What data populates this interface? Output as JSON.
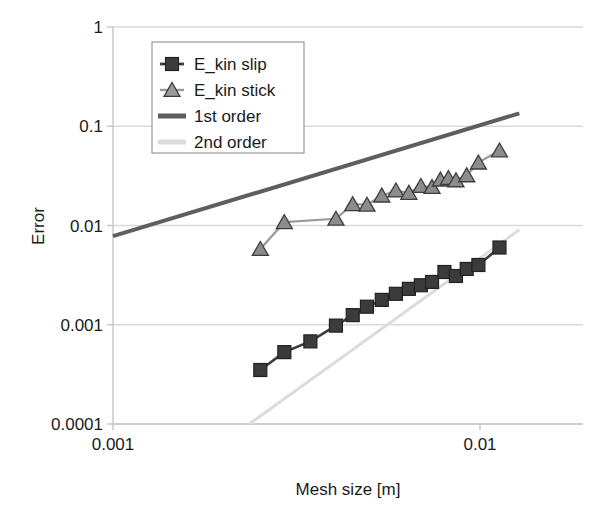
{
  "chart_data": {
    "type": "line",
    "title": "",
    "xlabel": "Mesh size [m]",
    "ylabel": "Error",
    "xscale": "log",
    "yscale": "log",
    "xlim": [
      0.001,
      0.0128
    ],
    "ylim": [
      0.0001,
      1
    ],
    "grid": true,
    "legend_position": "top-left",
    "xticks": [
      0.001,
      0.01
    ],
    "xtick_labels": [
      "0.001",
      "0.01"
    ],
    "yticks": [
      0.0001,
      0.001,
      0.01,
      0.1,
      1
    ],
    "ytick_labels": [
      "0.0001",
      "0.001",
      "0.01",
      "0.1",
      "1"
    ],
    "series": [
      {
        "name": "E_kin slip",
        "marker": "square",
        "color": "#3b3b3b",
        "line_color": "#3b3b3b",
        "x": [
          0.00252,
          0.00293,
          0.00345,
          0.00405,
          0.0045,
          0.00492,
          0.0054,
          0.0059,
          0.0064,
          0.0069,
          0.0074,
          0.008,
          0.0086,
          0.0092,
          0.0099,
          0.0113
        ],
        "y": [
          0.00035,
          0.00053,
          0.00068,
          0.00098,
          0.00125,
          0.00152,
          0.00178,
          0.00205,
          0.0023,
          0.0025,
          0.0027,
          0.0034,
          0.0031,
          0.00365,
          0.004,
          0.006
        ]
      },
      {
        "name": "E_kin stick",
        "marker": "triangle",
        "color": "#8c8c8c",
        "line_color": "#9a9a9a",
        "x": [
          0.00252,
          0.00293,
          0.00405,
          0.0045,
          0.00492,
          0.0054,
          0.0059,
          0.0064,
          0.0069,
          0.0074,
          0.0078,
          0.0082,
          0.0086,
          0.0092,
          0.0099,
          0.0113
        ],
        "y": [
          0.0058,
          0.0108,
          0.0117,
          0.0164,
          0.0162,
          0.02,
          0.0225,
          0.0213,
          0.025,
          0.0244,
          0.029,
          0.03,
          0.0285,
          0.032,
          0.043,
          0.057
        ]
      }
    ],
    "reference_lines": [
      {
        "name": "1st order",
        "slope": 1,
        "color": "#5e5e5e",
        "width": 4,
        "x": [
          0.001,
          0.0128
        ],
        "y": [
          0.0078,
          0.135
        ]
      },
      {
        "name": "2nd order",
        "slope": 2,
        "color": "#dcdcdc",
        "width": 3,
        "x": [
          0.00235,
          0.0128
        ],
        "y": [
          0.0001,
          0.00905
        ]
      }
    ],
    "legend_entries": [
      {
        "label": "E_kin slip",
        "marker": "square",
        "color": "#3b3b3b"
      },
      {
        "label": "E_kin stick",
        "marker": "triangle",
        "color": "#9a9a9a"
      },
      {
        "label": "1st order",
        "marker": "line",
        "color": "#5e5e5e"
      },
      {
        "label": "2nd order",
        "marker": "line",
        "color": "#dcdcdc"
      }
    ]
  },
  "axes": {
    "y_title": "Error",
    "x_title": "Mesh size [m]",
    "y_labels": [
      "1",
      "0.1",
      "0.01",
      "0.001",
      "0.0001"
    ],
    "x_labels": [
      "0.001",
      "0.01"
    ]
  },
  "legend": {
    "item0": "E_kin slip",
    "item1": "E_kin stick",
    "item2": "1st order",
    "item3": "2nd order"
  },
  "colors": {
    "slip": "#3b3b3b",
    "stick": "#9a9a9a",
    "first_order": "#5e5e5e",
    "second_order": "#dcdcdc",
    "grid": "#d9d9d9",
    "axis": "#c8c8c8",
    "text": "#1a1a1a"
  }
}
